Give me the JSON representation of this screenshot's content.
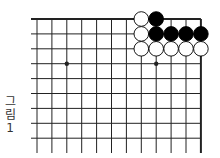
{
  "figure": {
    "caption_lines": [
      "그",
      "림",
      "1"
    ],
    "caption": "그림 1"
  },
  "board": {
    "columns": 12,
    "rows": 9,
    "origin_x": 37,
    "origin_y": 19,
    "spacing": 14.9,
    "top_edge": true,
    "right_edge": true,
    "star_points": [
      [
        2,
        3
      ],
      [
        8,
        3
      ]
    ],
    "stones": [
      {
        "color": "white",
        "col": 7,
        "row": 0
      },
      {
        "color": "black",
        "col": 8,
        "row": 0
      },
      {
        "color": "white",
        "col": 7,
        "row": 1
      },
      {
        "color": "black",
        "col": 8,
        "row": 1
      },
      {
        "color": "black",
        "col": 9,
        "row": 1
      },
      {
        "color": "black",
        "col": 10,
        "row": 1
      },
      {
        "color": "black",
        "col": 11,
        "row": 1
      },
      {
        "color": "white",
        "col": 7,
        "row": 2
      },
      {
        "color": "white",
        "col": 8,
        "row": 2
      },
      {
        "color": "white",
        "col": 9,
        "row": 2
      },
      {
        "color": "white",
        "col": 10,
        "row": 2
      },
      {
        "color": "white",
        "col": 11,
        "row": 2
      }
    ],
    "colors": {
      "line": "#222222",
      "black_stone": "#000000",
      "white_stone": "#ffffff"
    }
  }
}
